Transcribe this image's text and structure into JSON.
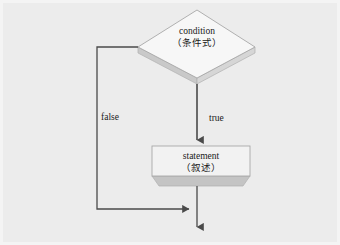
{
  "diagram": {
    "background_color": "#ececec",
    "nodes": [
      {
        "id": "condition",
        "shape": "diamond",
        "label_en": "condition",
        "label_cjk": "（条件式）",
        "fill": "#f7f7f7",
        "shadow": "#c9c9c9",
        "stroke": "#9a9a9a"
      },
      {
        "id": "statement",
        "shape": "rectangle",
        "label_en": "statement",
        "label_cjk": "（叙述）",
        "fill": "#f2f2f2",
        "shadow": "#c4c4c4",
        "stroke": "#9a9a9a"
      }
    ],
    "edges": [
      {
        "id": "true-edge",
        "from": "condition",
        "to": "statement",
        "label": "true",
        "direction": "down"
      },
      {
        "id": "false-edge",
        "from": "condition",
        "to": "exit",
        "label": "false",
        "direction": "left-down-right"
      },
      {
        "id": "loop-exit",
        "from": "statement",
        "to": "exit",
        "label": "",
        "direction": "down"
      }
    ],
    "line_color": "#4a4a4a"
  }
}
